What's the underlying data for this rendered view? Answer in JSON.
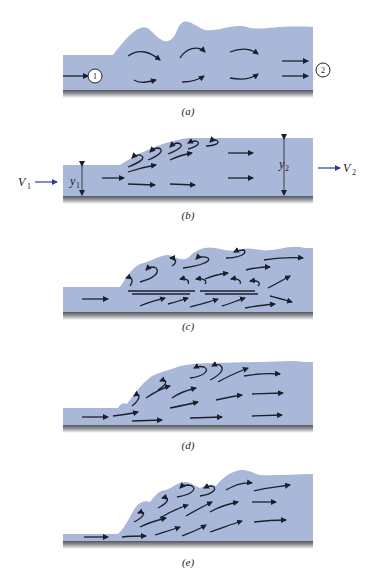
{
  "figure": {
    "panels": [
      {
        "id": "a",
        "caption": "(a)",
        "labels": {
          "upstream_section": "1",
          "downstream_section": "2"
        }
      },
      {
        "id": "b",
        "caption": "(b)",
        "labels": {
          "upstream_velocity": "V",
          "upstream_velocity_sub": "1",
          "downstream_velocity": "V",
          "downstream_velocity_sub": "2",
          "upstream_depth": "y",
          "upstream_depth_sub": "1",
          "downstream_depth": "y",
          "downstream_depth_sub": "2"
        }
      },
      {
        "id": "c",
        "caption": "(c)"
      },
      {
        "id": "d",
        "caption": "(d)"
      },
      {
        "id": "e",
        "caption": "(e)"
      }
    ],
    "colors": {
      "water": "#a9b8d8",
      "bed": "#6d6f74",
      "arrows": "#1b1f2b",
      "velocity_arrows": "#2a3f9a"
    }
  }
}
